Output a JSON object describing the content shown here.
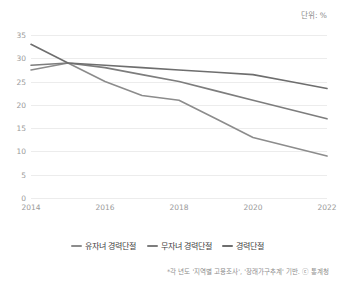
{
  "header": {
    "title": "",
    "unit_label": "단위: %"
  },
  "footnote": "*각 년도 '지역별 고용조사', '장래가구추계' 기반. ⓒ 통계청",
  "legend": {
    "items": [
      {
        "label": "유자녀 경력단절",
        "color": "#8c8c8c"
      },
      {
        "label": "무자녀 경력단절",
        "color": "#7d7d7d"
      },
      {
        "label": "경력단절",
        "color": "#6e6e6e"
      }
    ]
  },
  "chart_data": {
    "type": "line",
    "title": "",
    "xlabel": "",
    "ylabel": "",
    "unit": "%",
    "ylim": [
      0,
      35
    ],
    "yticks": [
      0,
      5,
      10,
      15,
      20,
      25,
      30,
      35
    ],
    "xlim": [
      2014,
      2022
    ],
    "xticks": [
      2014,
      2016,
      2018,
      2020,
      2022
    ],
    "x": [
      2014,
      2015,
      2016,
      2017,
      2018,
      2019,
      2020,
      2021,
      2022
    ],
    "grid": true,
    "legend_position": "bottom",
    "series": [
      {
        "name": "유자녀 경력단절",
        "color": "#8c8c8c",
        "values": [
          27.5,
          29.0,
          25.0,
          22.0,
          21.0,
          17.0,
          13.0,
          11.0,
          9.0
        ]
      },
      {
        "name": "무자녀 경력단절",
        "color": "#7d7d7d",
        "values": [
          28.5,
          29.0,
          28.0,
          26.5,
          25.0,
          23.0,
          21.0,
          19.0,
          17.0
        ]
      },
      {
        "name": "경력단절",
        "color": "#6e6e6e",
        "values": [
          33.0,
          29.0,
          28.5,
          28.0,
          27.5,
          27.0,
          26.5,
          25.0,
          23.5
        ]
      }
    ]
  }
}
